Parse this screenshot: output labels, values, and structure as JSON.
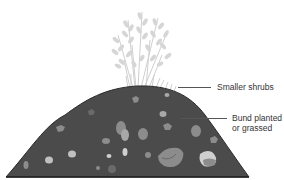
{
  "diagram": {
    "type": "cross-section illustration",
    "colors": {
      "background": "#ffffff",
      "mound_fill": "#4b4b4b",
      "mound_outline": "#2a2a2a",
      "stone_mid": "#8c8c8c",
      "stone_light": "#a8a8a8",
      "stone_pale": "#cfcfcf",
      "vegetation": "#cfcfcf",
      "label_text": "#333333",
      "leader_line": "#555555"
    },
    "labels": [
      {
        "id": "shrubs",
        "text": "Smaller shrubs"
      },
      {
        "id": "bund",
        "line1": "Bund planted",
        "line2": "or grassed"
      }
    ]
  }
}
